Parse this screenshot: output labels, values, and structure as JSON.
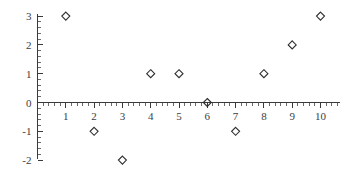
{
  "chart_data": {
    "type": "scatter",
    "title": "",
    "subtitle": "",
    "xlabel": "",
    "ylabel": "",
    "x": [
      1,
      2,
      3,
      4,
      5,
      6,
      7,
      8,
      9,
      10
    ],
    "values": [
      3,
      -1,
      -2,
      1,
      1,
      0,
      -1,
      1,
      2,
      3
    ],
    "points": [
      {
        "x": 1,
        "y": 3
      },
      {
        "x": 2,
        "y": -1
      },
      {
        "x": 3,
        "y": -2
      },
      {
        "x": 4,
        "y": 1
      },
      {
        "x": 5,
        "y": 1
      },
      {
        "x": 6,
        "y": 0
      },
      {
        "x": 7,
        "y": -1
      },
      {
        "x": 8,
        "y": 1
      },
      {
        "x": 9,
        "y": 2
      },
      {
        "x": 10,
        "y": 3
      }
    ],
    "xlim": [
      0,
      10.6
    ],
    "ylim": [
      -2,
      3
    ],
    "x_ticks": [
      1,
      2,
      3,
      4,
      5,
      6,
      7,
      8,
      9,
      10
    ],
    "x_tick_labels": [
      "1",
      "2",
      "3",
      "4",
      "5",
      "6",
      "7",
      "8",
      "9",
      "10"
    ],
    "y_ticks": [
      -2,
      -1,
      0,
      1,
      2,
      3
    ],
    "y_tick_labels": [
      "-2",
      "-1",
      "0",
      "1",
      "2",
      "3"
    ],
    "x_minor_ticks_per_interval": 4,
    "y_minor_ticks_per_interval": 4,
    "grid": false,
    "legend": false,
    "legend_position": "none",
    "marker": "open-diamond",
    "marker_size": 8,
    "annotations": []
  },
  "style": {
    "background_color": "#ffffff",
    "axis_color": "#3a3a3a",
    "marker_stroke_color": "#2e2e2e",
    "tick_label_color": "#3d3d3d",
    "minor_tick_color": "#5a5a5a"
  },
  "geometry": {
    "width": 351,
    "height": 177,
    "x_axis_pixel_y": 102,
    "y_axis_pixel_x": 37,
    "x_pixels_per_unit": 28.3,
    "y_pixels_per_unit": 28.8,
    "x_axis_left": 37,
    "x_axis_right": 340,
    "y_axis_top": 14,
    "y_axis_bottom": 159
  }
}
